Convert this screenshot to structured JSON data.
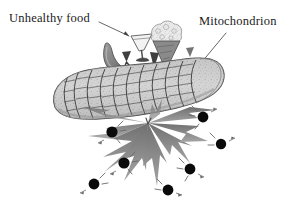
{
  "figure": {
    "width": 296,
    "height": 207,
    "background_color": "#ffffff",
    "style": "hand-drawn pencil sketch, grayscale"
  },
  "labels": {
    "unhealthy_food": "Unhealthy food",
    "mitochondrion": "Mitochondrion"
  },
  "colors": {
    "background": "#ffffff",
    "text": "#1b1b1b",
    "leader_line": "#555555",
    "organelle_outline": "#4a4a4a",
    "organelle_fill": "#cfcfcf",
    "organelle_shadow": "#9a9a9a",
    "sausage_fill": "#8d8d8d",
    "sausage_outline": "#4f4f4f",
    "glass_outline": "#5a5a5a",
    "cone_fill": "#8a8a8a",
    "scoop_fill": "#d8d8d8",
    "arrow_fill": "#3f3f3f",
    "burst_fill": "#8a8a8a",
    "burst_dark": "#5d5d5d",
    "radical_fill": "#0a0a0a",
    "tick_stroke": "#6a6a6a"
  },
  "elements": {
    "food_items": [
      {
        "name": "sausage",
        "label": "sausage"
      },
      {
        "name": "cocktail-glass",
        "label": "cocktail glass"
      },
      {
        "name": "ice-cream-cone",
        "label": "ice cream cone"
      }
    ],
    "organelle": {
      "name": "mitochondrion",
      "cristae_count": 11
    },
    "burst": {
      "name": "oxidative-burst",
      "ray_count": 9
    },
    "free_radicals": {
      "name": "free-radical-particles",
      "count": 7
    }
  }
}
